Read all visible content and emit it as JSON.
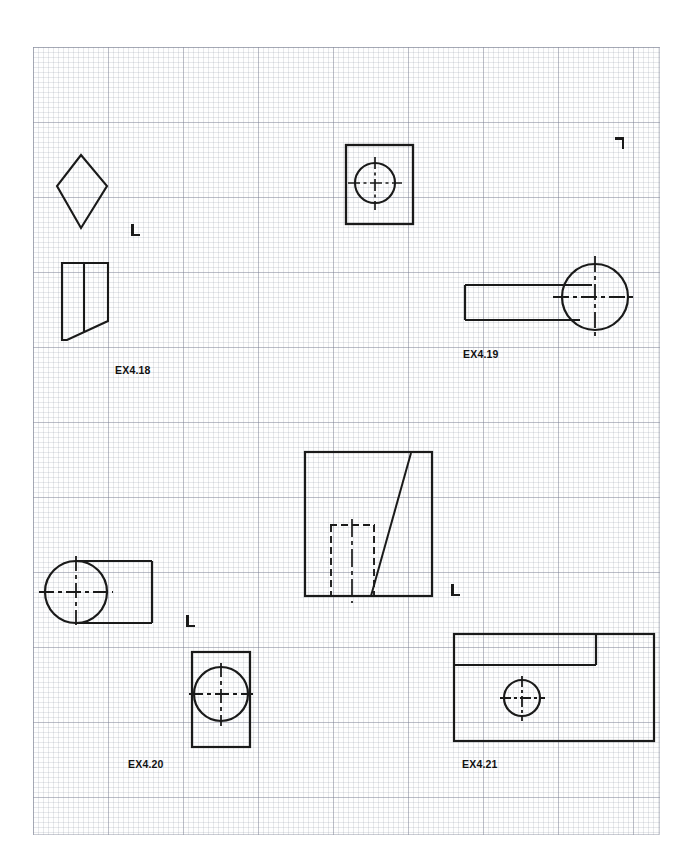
{
  "document": {
    "type": "technical-drawing-worksheet",
    "paper": "graph-paper",
    "background_color": "#ffffff",
    "grid_color": "#787d91",
    "line_color": "#1a1a1a",
    "page_width": 692,
    "page_height": 865
  },
  "grid": {
    "left": 33,
    "top": 47,
    "width": 627,
    "height": 788,
    "minor_spacing": 5,
    "major_spacing": 75
  },
  "exercises": [
    {
      "id": "ex-4-18",
      "label": "EX4.18",
      "label_x": 115,
      "label_y": 364,
      "description": "Diamond top view with trapezoidal front view"
    },
    {
      "id": "ex-4-19",
      "label": "EX4.19",
      "label_x": 463,
      "label_y": 348,
      "description": "Square plate with hole, plus rectangular arm with circular boss"
    },
    {
      "id": "ex-4-20",
      "label": "EX4.20",
      "label_x": 128,
      "label_y": 758,
      "description": "Circular boss with rectangular tab, plus rectangle with circle"
    },
    {
      "id": "ex-4-21",
      "label": "EX4.21",
      "label_x": 462,
      "label_y": 758,
      "description": "Stepped rectangular block with hole"
    }
  ],
  "corner_marks": [
    {
      "name": "corner-mark-1",
      "x": 131,
      "y": 224,
      "style": "l-normal"
    },
    {
      "name": "corner-mark-2",
      "x": 613,
      "y": 137,
      "style": "l-rot"
    },
    {
      "name": "corner-mark-3",
      "x": 186,
      "y": 615,
      "style": "l-normal"
    },
    {
      "name": "corner-mark-4",
      "x": 451,
      "y": 584,
      "style": "l-normal"
    }
  ],
  "figures": {
    "ex418_diamond": {
      "name": "diamond-outline",
      "points": "81,155 107,186 81,228 57,186"
    },
    "ex418_front": {
      "name": "trapezoid-front-view",
      "outline": "62,263 108,263 108,321 67,340 62,340",
      "divider": "84,263 84,332"
    },
    "ex419_plate": {
      "name": "square-plate-with-hole",
      "rect": {
        "x": 346,
        "y": 145,
        "width": 67,
        "height": 79
      },
      "circle": {
        "cx": 375,
        "cy": 183,
        "r": 20
      },
      "centerline_h": {
        "x1": 348,
        "y1": 183,
        "x2": 402,
        "y2": 183
      },
      "centerline_v": {
        "x1": 375,
        "y1": 157,
        "x2": 375,
        "y2": 210
      }
    },
    "ex419_arm": {
      "name": "arm-with-circular-boss",
      "circle": {
        "cx": 595,
        "cy": 297,
        "r": 33
      },
      "rect_top": {
        "x1": 465,
        "y1": 285,
        "x2": 592,
        "y2": 285
      },
      "rect_bottom": {
        "x1": 465,
        "y1": 320,
        "x2": 580,
        "y2": 320
      },
      "rect_left": {
        "x1": 465,
        "y1": 285,
        "x2": 465,
        "y2": 320
      },
      "centerline_h": {
        "x1": 553,
        "y1": 297,
        "x2": 637,
        "y2": 297
      },
      "centerline_v": {
        "x1": 595,
        "y1": 256,
        "x2": 595,
        "y2": 339
      }
    },
    "center_block": {
      "name": "stepped-block-with-slot",
      "rect": {
        "x": 305,
        "y": 452,
        "width": 127,
        "height": 144
      },
      "diagonal": "411,452 411,454 371,596",
      "slot_left": {
        "x1": 331,
        "y1": 525,
        "x2": 331,
        "y2": 596
      },
      "slot_right": {
        "x1": 374,
        "y1": 525,
        "x2": 374,
        "y2": 596
      },
      "slot_top": {
        "x1": 331,
        "y1": 525,
        "x2": 374,
        "y2": 525
      },
      "centerline_v": {
        "x1": 352,
        "y1": 519,
        "x2": 352,
        "y2": 603
      }
    },
    "ex420_top": {
      "name": "boss-with-tab-top-view",
      "circle": {
        "cx": 76,
        "cy": 592,
        "r": 31
      },
      "rect_top": {
        "x1": 76,
        "y1": 561,
        "x2": 152,
        "y2": 561
      },
      "rect_bottom": {
        "x1": 76,
        "y1": 623,
        "x2": 152,
        "y2": 623
      },
      "rect_right": {
        "x1": 152,
        "y1": 561,
        "x2": 152,
        "y2": 623
      },
      "centerline_h": {
        "x1": 39,
        "y1": 592,
        "x2": 113,
        "y2": 592
      },
      "centerline_v": {
        "x1": 76,
        "y1": 556,
        "x2": 76,
        "y2": 628
      }
    },
    "ex420_front": {
      "name": "rect-with-circle-front-view",
      "rect": {
        "x": 192,
        "y": 652,
        "width": 58,
        "height": 95
      },
      "circle": {
        "cx": 221,
        "cy": 694,
        "r": 27
      },
      "centerline_h": {
        "x1": 189,
        "y1": 694,
        "x2": 253,
        "y2": 694
      },
      "centerline_v": {
        "x1": 221,
        "y1": 663,
        "x2": 221,
        "y2": 726
      }
    },
    "ex421_block": {
      "name": "stepped-block-with-hole",
      "rect": {
        "x": 454,
        "y": 634,
        "width": 200,
        "height": 107
      },
      "step_vertical": {
        "x1": 596,
        "y1": 634,
        "x2": 596,
        "y2": 665
      },
      "step_horizontal": {
        "x1": 454,
        "y1": 665,
        "x2": 596,
        "y2": 665
      },
      "circle": {
        "cx": 522,
        "cy": 698,
        "r": 18
      },
      "centerline_h": {
        "x1": 500,
        "y1": 698,
        "x2": 545,
        "y2": 698
      },
      "centerline_v": {
        "x1": 522,
        "y1": 676,
        "x2": 522,
        "y2": 721
      }
    }
  }
}
